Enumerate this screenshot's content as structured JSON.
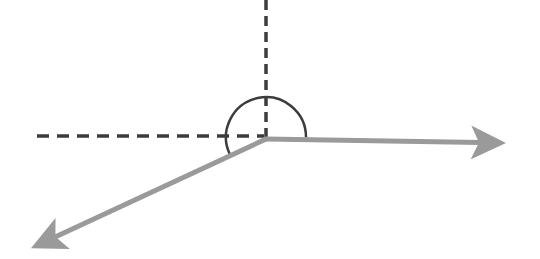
{
  "diagram": {
    "title": "",
    "type": "angle-diagram",
    "colors": {
      "background": "#ffffff",
      "vector": "#9a9a9a",
      "dashed_axis": "#3c3c3c",
      "arc": "#3c3c3c"
    },
    "vertex": {
      "x": 266,
      "y": 139
    },
    "vectors": [
      {
        "name": "right-vector",
        "from": [
          266,
          139
        ],
        "to": [
          510,
          143
        ]
      },
      {
        "name": "lower-left-vector",
        "from": [
          266,
          139
        ],
        "to": [
          27,
          250
        ]
      }
    ],
    "reference_axes": [
      {
        "name": "vertical-dashed-axis",
        "from": [
          266,
          0
        ],
        "to": [
          266,
          139
        ]
      },
      {
        "name": "horizontal-dashed-axis",
        "from": [
          37,
          136
        ],
        "to": [
          266,
          136
        ]
      }
    ],
    "angle_arc": {
      "center": [
        266,
        137
      ],
      "radius": 40
    }
  }
}
